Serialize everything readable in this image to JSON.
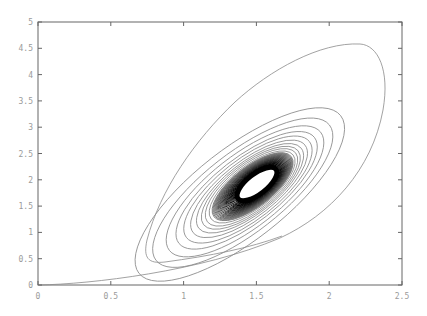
{
  "chart_data": {
    "type": "contour",
    "title": "",
    "xlabel": "",
    "ylabel": "",
    "xlim": [
      0,
      2.5
    ],
    "ylim": [
      0,
      5
    ],
    "x_ticks": [
      "0",
      "0.5",
      "1",
      "1.5",
      "2",
      "2.5"
    ],
    "y_ticks": [
      "0",
      "0.5",
      "1",
      "1.5",
      "2",
      "2.5",
      "3",
      "3.5",
      "4",
      "4.5",
      "5"
    ],
    "grid": false,
    "legend": null,
    "center": {
      "x": 1.52,
      "y": 1.9
    },
    "outer_contour_extent": {
      "x_min": 0.0,
      "x_max": 2.35,
      "y_min": 0.0,
      "y_max": 4.55
    },
    "contour_count_visible": 40
  }
}
